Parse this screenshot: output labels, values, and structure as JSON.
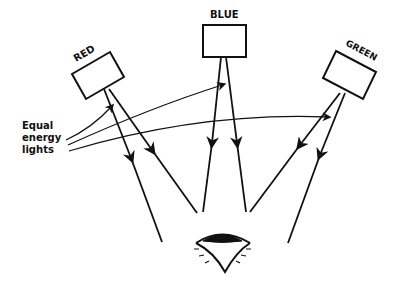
{
  "diagram": {
    "sources": [
      {
        "id": "red",
        "label": "RED"
      },
      {
        "id": "blue",
        "label": "BLUE"
      },
      {
        "id": "green",
        "label": "GREEN"
      }
    ],
    "side_label": {
      "lines": [
        "Equal",
        "energy",
        "lights"
      ]
    },
    "observer": "eye",
    "colors": {
      "ink": "#111111",
      "background": "#ffffff"
    }
  }
}
